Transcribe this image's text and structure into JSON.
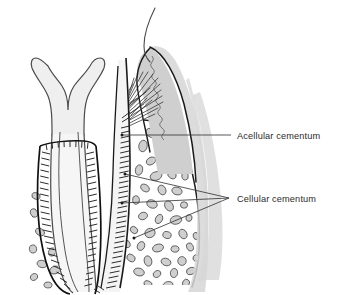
{
  "figure": {
    "type": "anatomical-line-diagram",
    "width": 340,
    "height": 295,
    "background_color": "#ffffff"
  },
  "labels": {
    "acellular": {
      "text": "Acellular cementum",
      "x": 237,
      "y": 139,
      "leader_from_x": 228,
      "leader_from_y": 135,
      "anchor_x": 122,
      "anchor_y": 135
    },
    "cellular": {
      "text": "Cellular cementum",
      "x": 237,
      "y": 202,
      "leader_hub_x": 229,
      "leader_hub_y": 198,
      "anchor_points": [
        {
          "x": 125,
          "y": 174
        },
        {
          "x": 122,
          "y": 203
        },
        {
          "x": 133,
          "y": 238
        }
      ]
    }
  },
  "colors": {
    "outline": "#1a1a1a",
    "soft_outline": "#4a4a4a",
    "leader_line": "#3a3a3a",
    "label_text": "#2b2b2b",
    "gingiva_fill": "#cfcfcf",
    "gingiva_fill_light": "#dcdcdc",
    "tooth_fill": "#f2f2f2",
    "dentin_fill": "#fafafa",
    "pulp_fill": "#ffffff",
    "bone_fill": "#ffffff",
    "marrow_fill": "#cfcfcf",
    "marrow_stroke": "#555555",
    "shadow_band": "#d8d8d8",
    "hatch_stroke": "#2a2a2a",
    "fiber_stroke": "#303030"
  },
  "structures": [
    {
      "name": "adjacent-tooth-crown-edge",
      "description": "thin curved line at top"
    },
    {
      "name": "gingiva",
      "description": "gray wedge-shaped gum tissue at upper right of root"
    },
    {
      "name": "junctional-epithelium-wave",
      "description": "wavy line inside gingiva"
    },
    {
      "name": "gingival-fiber-bundles",
      "description": "fan of fine lines from root into gingiva"
    },
    {
      "name": "left-tooth-root",
      "description": "flared root form at left"
    },
    {
      "name": "left-root-pulp-canal",
      "description": "inner canal of left root"
    },
    {
      "name": "right-tooth-root",
      "description": "main root shown in section"
    },
    {
      "name": "periodontal-ligament-hatching",
      "description": "vertical tick marks along root surfaces"
    },
    {
      "name": "alveolar-bone",
      "description": "bone surrounding roots"
    },
    {
      "name": "bone-marrow-spaces",
      "description": "scattered rounded gray blobs in bone"
    },
    {
      "name": "shadow-band",
      "description": "soft gray band right of bone outline"
    }
  ]
}
